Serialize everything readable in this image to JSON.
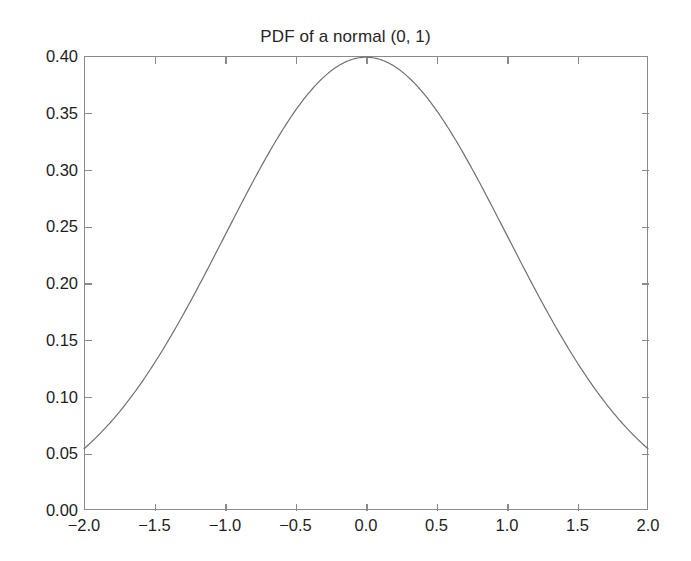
{
  "chart_data": {
    "type": "line",
    "title": "PDF of a normal (0, 1)",
    "xlabel": "",
    "ylabel": "",
    "xlim": [
      -2.0,
      2.0
    ],
    "ylim": [
      0.0,
      0.4
    ],
    "grid": false,
    "legend": null,
    "legend_position": "none",
    "line_color": "#707070",
    "axis_color": "#8a8a8a",
    "background_color": "#ffffff",
    "text_color": "#1d1d1d",
    "xticks": [
      -2.0,
      -1.5,
      -1.0,
      -0.5,
      0.0,
      0.5,
      1.0,
      1.5,
      2.0
    ],
    "xticklabels": [
      "−2.0",
      "−1.5",
      "−1.0",
      "−0.5",
      "0.0",
      "0.5",
      "1.0",
      "1.5",
      "2.0"
    ],
    "yticks": [
      0.0,
      0.05,
      0.1,
      0.15,
      0.2,
      0.25,
      0.3,
      0.35,
      0.4
    ],
    "yticklabels": [
      "0.00",
      "0.05",
      "0.10",
      "0.15",
      "0.20",
      "0.25",
      "0.30",
      "0.35",
      "0.40"
    ],
    "series": [
      {
        "name": "normal pdf (mu=0, sigma=1)",
        "x": [
          -2.0,
          -1.9,
          -1.8,
          -1.7,
          -1.6,
          -1.5,
          -1.4,
          -1.3,
          -1.2,
          -1.1,
          -1.0,
          -0.9,
          -0.8,
          -0.7,
          -0.6,
          -0.5,
          -0.4,
          -0.3,
          -0.2,
          -0.1,
          0.0,
          0.1,
          0.2,
          0.3,
          0.4,
          0.5,
          0.6,
          0.7,
          0.8,
          0.9,
          1.0,
          1.1,
          1.2,
          1.3,
          1.4,
          1.5,
          1.6,
          1.7,
          1.8,
          1.9,
          2.0
        ],
        "y": [
          0.054,
          0.0656,
          0.079,
          0.0941,
          0.1109,
          0.1295,
          0.1497,
          0.1714,
          0.1942,
          0.2179,
          0.242,
          0.2661,
          0.2897,
          0.3123,
          0.3332,
          0.3521,
          0.3683,
          0.3814,
          0.391,
          0.397,
          0.3989,
          0.397,
          0.391,
          0.3814,
          0.3683,
          0.3521,
          0.3332,
          0.3123,
          0.2897,
          0.2661,
          0.242,
          0.2179,
          0.1942,
          0.1714,
          0.1497,
          0.1295,
          0.1109,
          0.0941,
          0.079,
          0.0656,
          0.054
        ]
      }
    ]
  }
}
